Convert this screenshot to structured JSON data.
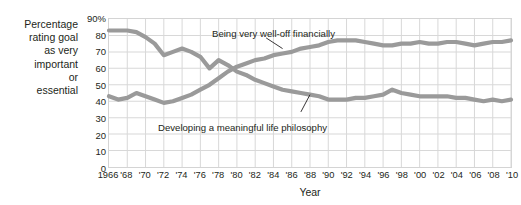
{
  "chart_data": {
    "type": "line",
    "title": "",
    "xlabel": "Year",
    "ylabel": "Percentage rating goal as very important or essential",
    "xlim": [
      1966,
      2010
    ],
    "ylim": [
      0,
      90
    ],
    "grid": true,
    "legend_position": "inline-annotations",
    "y_ticks": [
      90,
      80,
      70,
      60,
      50,
      40,
      30,
      20,
      10,
      0
    ],
    "y_tick_labels": [
      "90%",
      "80",
      "70",
      "60",
      "50",
      "40",
      "30",
      "20",
      "10",
      "0"
    ],
    "x_ticks": [
      1966,
      1968,
      1970,
      1972,
      1974,
      1976,
      1978,
      1980,
      1982,
      1984,
      1986,
      1988,
      1990,
      1992,
      1994,
      1996,
      1998,
      2000,
      2002,
      2004,
      2006,
      2008,
      2010
    ],
    "x_tick_labels": [
      "1966",
      "'68",
      "'70",
      "'72",
      "'74",
      "'76",
      "'78",
      "'80",
      "'82",
      "'84",
      "'86",
      "'88",
      "'90",
      "'92",
      "'94",
      "'96",
      "'98",
      "'00",
      "'02",
      "'04",
      "'06",
      "'08",
      "'10"
    ],
    "x": [
      1966,
      1967,
      1968,
      1969,
      1970,
      1971,
      1972,
      1973,
      1974,
      1975,
      1976,
      1977,
      1978,
      1979,
      1980,
      1981,
      1982,
      1983,
      1984,
      1985,
      1986,
      1987,
      1988,
      1989,
      1990,
      1991,
      1992,
      1993,
      1994,
      1995,
      1996,
      1997,
      1998,
      1999,
      2000,
      2001,
      2002,
      2003,
      2004,
      2005,
      2006,
      2007,
      2008,
      2009,
      2010
    ],
    "series": [
      {
        "name": "Developing a meaningful life philosophy",
        "color": "#9a9a9a",
        "values": [
          83,
          83,
          83,
          82,
          79,
          75,
          68,
          70,
          72,
          70,
          67,
          60,
          65,
          62,
          58,
          56,
          53,
          51,
          49,
          47,
          46,
          45,
          44,
          43,
          41,
          41,
          41,
          42,
          42,
          43,
          44,
          47,
          45,
          44,
          43,
          43,
          43,
          43,
          42,
          42,
          41,
          40,
          41,
          40,
          41
        ]
      },
      {
        "name": "Being very well-off financially",
        "color": "#9a9a9a",
        "values": [
          43,
          41,
          42,
          45,
          43,
          41,
          39,
          40,
          42,
          44,
          47,
          50,
          54,
          58,
          61,
          63,
          65,
          66,
          68,
          69,
          70,
          72,
          73,
          74,
          76,
          77,
          77,
          77,
          76,
          75,
          74,
          74,
          75,
          75,
          76,
          75,
          75,
          76,
          76,
          75,
          74,
          75,
          76,
          76,
          77
        ]
      }
    ],
    "annotations": [
      {
        "name": "upper",
        "text": "Being very well-off financially",
        "points_to_year": 1985,
        "points_to_value": 72
      },
      {
        "name": "lower",
        "text": "Developing a meaningful life philosophy",
        "points_to_year": 1988,
        "points_to_value": 44
      }
    ]
  },
  "axis": {
    "y_title_lines": [
      "Percentage",
      "rating goal",
      "as very",
      "important",
      "or",
      "essential"
    ],
    "x_title": "Year"
  },
  "colors": {
    "line": "#9a9a9a",
    "grid": "#d8d8d8",
    "border": "#d4d4d4",
    "text": "#231f20",
    "background": "#ffffff"
  }
}
